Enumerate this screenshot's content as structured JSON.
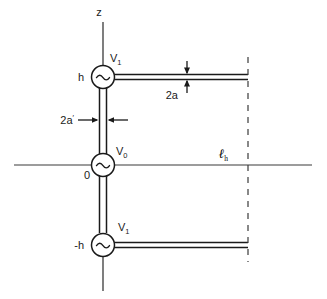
{
  "figure": {
    "background_color": "#ffffff",
    "line_color": "#1a1a1a",
    "labels": {
      "z_axis": "z",
      "upper_source_voltage": "V",
      "upper_source_voltage_sub": "1",
      "upper_height": "h",
      "conductor_diameter_2a": "2a",
      "feedline_diameter_2a_prime": "2a",
      "feedline_diameter_prime_mark": "′",
      "origin_voltage": "V",
      "origin_voltage_sub": "0",
      "origin": "0",
      "horizontal_length": "ℓ",
      "horizontal_length_sub": "h",
      "lower_source_voltage": "V",
      "lower_source_voltage_sub": "1",
      "lower_height": "-h"
    },
    "sources": [
      {
        "name": "upper-ac-source",
        "symbol": "~",
        "position_label": "h",
        "voltage": "V1"
      },
      {
        "name": "origin-ac-source",
        "symbol": "~",
        "position_label": "0",
        "voltage": "V0"
      },
      {
        "name": "lower-ac-source",
        "symbol": "~",
        "position_label": "-h",
        "voltage": "V1"
      }
    ],
    "annotations": [
      {
        "name": "2a-dimension",
        "text": "2a",
        "kind": "vertical-double-arrow"
      },
      {
        "name": "2a-prime-dimension",
        "text": "2a′",
        "kind": "horizontal-double-arrow"
      },
      {
        "name": "lh-dimension",
        "text": "ℓh",
        "kind": "dashed-reference-line"
      }
    ]
  }
}
